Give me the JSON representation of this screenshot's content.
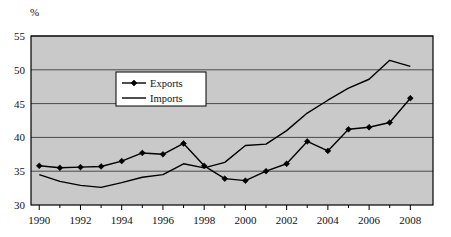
{
  "chart_data": {
    "type": "line",
    "title": "",
    "subtitle": "",
    "xlabel": "",
    "ylabel": "%",
    "unit_label": "%",
    "x": [
      1990,
      1991,
      1992,
      1993,
      1994,
      1995,
      1996,
      1997,
      1998,
      1999,
      2000,
      2001,
      2002,
      2003,
      2004,
      2005,
      2006,
      2007,
      2008
    ],
    "xtick_labels": [
      "1990",
      "1992",
      "1994",
      "1996",
      "1998",
      "2000",
      "2002",
      "2004",
      "2006",
      "2008"
    ],
    "xtick_values": [
      1990,
      1992,
      1994,
      1996,
      1998,
      2000,
      2002,
      2004,
      2006,
      2008
    ],
    "xminor_ticks": [
      1990,
      1991,
      1992,
      1993,
      1994,
      1995,
      1996,
      1997,
      1998,
      1999,
      2000,
      2001,
      2002,
      2003,
      2004,
      2005,
      2006,
      2007,
      2008
    ],
    "ytick_labels": [
      "30",
      "35",
      "40",
      "45",
      "50",
      "55"
    ],
    "ytick_values": [
      30,
      35,
      40,
      45,
      50,
      55
    ],
    "xlim": [
      1989.6,
      2009.1
    ],
    "ylim": [
      30,
      55
    ],
    "grid": true,
    "grid_axis": "y",
    "legend_position": "upper-left-inset",
    "plot_background": "#c9c9c9",
    "grid_color": "#4a4a4a",
    "axis_color": "#000000",
    "series": [
      {
        "name": "Exports",
        "marker": "diamond",
        "color": "#000000",
        "values": [
          35.8,
          35.5,
          35.6,
          35.7,
          36.5,
          37.7,
          37.5,
          39.1,
          35.8,
          33.9,
          33.6,
          35.0,
          36.1,
          39.4,
          38.0,
          41.2,
          41.5,
          42.2,
          45.8
        ]
      },
      {
        "name": "Imports",
        "marker": "none",
        "color": "#000000",
        "values": [
          34.5,
          33.5,
          32.9,
          32.6,
          33.3,
          34.1,
          34.5,
          36.1,
          35.5,
          36.3,
          38.8,
          39.0,
          41.0,
          43.6,
          45.5,
          47.3,
          48.6,
          51.4,
          50.5
        ]
      }
    ]
  },
  "legend": {
    "items": [
      {
        "label": "Exports",
        "marker": "diamond"
      },
      {
        "label": "Imports",
        "marker": "line"
      }
    ]
  }
}
